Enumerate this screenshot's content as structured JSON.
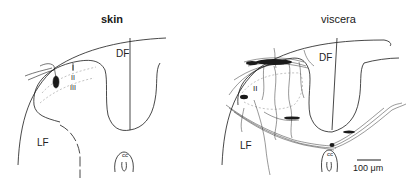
{
  "figure": {
    "panels": [
      {
        "title": "skin",
        "labels": {
          "dorsal_funiculus": "DF",
          "lateral_funiculus": "LF",
          "central_canal": "cc",
          "lamina_1": "I",
          "lamina_2": "II",
          "lamina_3": "III"
        }
      },
      {
        "title": "viscera",
        "labels": {
          "dorsal_funiculus": "DF",
          "lateral_funiculus": "LF",
          "central_canal": "cc",
          "lamina_2": "II"
        },
        "scale_bar": "100 μm"
      }
    ],
    "colors": {
      "line": "#1a1a1a",
      "background": "#ffffff",
      "lamina_dash": "#9a9a9a"
    }
  }
}
